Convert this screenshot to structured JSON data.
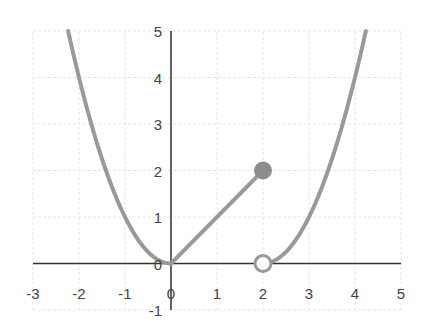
{
  "chart_data": {
    "type": "line",
    "title": "",
    "xlabel": "",
    "ylabel": "",
    "xlim": [
      -3,
      5
    ],
    "ylim": [
      -1,
      5
    ],
    "grid": true,
    "legend": null,
    "x_ticks": [
      "-3",
      "-2",
      "-1",
      "0",
      "1",
      "2",
      "3",
      "4",
      "5"
    ],
    "y_ticks": [
      "-1",
      "0",
      "1",
      "2",
      "3",
      "4",
      "5"
    ],
    "series": [
      {
        "name": "left parabola",
        "description": "y = x^2 for x <= 0",
        "x": [
          -2.24,
          -2,
          -1.5,
          -1,
          -0.5,
          0
        ],
        "y": [
          5,
          4,
          2.25,
          1,
          0.25,
          0
        ]
      },
      {
        "name": "line segment",
        "description": "y = x for 0 <= x <= 2",
        "x": [
          0,
          2
        ],
        "y": [
          0,
          2
        ]
      },
      {
        "name": "right parabola",
        "description": "y = (x-2)^2 for x > 2",
        "x": [
          2,
          2.5,
          3,
          3.5,
          4,
          4.24
        ],
        "y": [
          0,
          0.25,
          1,
          2.25,
          4,
          5
        ]
      }
    ],
    "points": [
      {
        "label": "closed point",
        "x": 2,
        "y": 2,
        "style": "filled"
      },
      {
        "label": "open point",
        "x": 2,
        "y": 0,
        "style": "open"
      }
    ]
  },
  "colors": {
    "curve": "#999999",
    "axis": "#333333",
    "grid": "#e6e6e6",
    "text": "#444444"
  }
}
